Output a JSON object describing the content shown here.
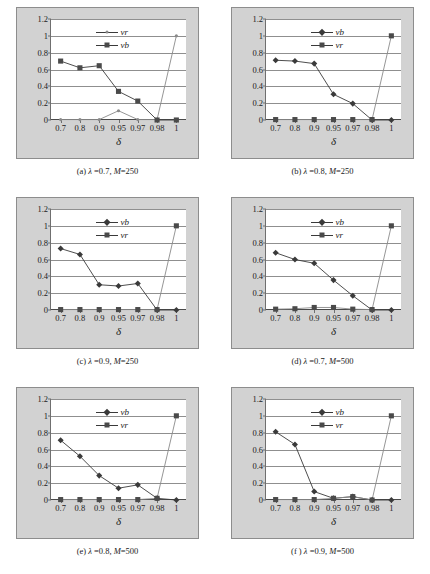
{
  "figure": {
    "panel_count": 6,
    "x_label": "δ",
    "y_ticks": [
      "1.2",
      "1",
      "0.8",
      "0.6",
      "0.4",
      "0.2",
      "0"
    ],
    "x_ticks": [
      "0.7",
      "0.8",
      "0.9",
      "0.95",
      "0.97",
      "0.98",
      "1"
    ],
    "ylim": [
      0,
      1.2
    ],
    "colors": {
      "panel_background": "#d2d2d2",
      "plot_background": "#ffffff",
      "gridline": "#8f8f8f",
      "series_vb": "#3a3a3a",
      "series_vr": "#8a8a8a",
      "text": "#1b1b1b"
    }
  },
  "chart_data": [
    {
      "type": "line",
      "panel": "a",
      "title": "(a) λ =0.7, M=250",
      "caption_prefix": "(a) ",
      "lambda": "0.7",
      "M": "250",
      "xlabel": "δ",
      "ylabel": "",
      "x": [
        "0.7",
        "0.8",
        "0.9",
        "0.95",
        "0.97",
        "0.98",
        "1"
      ],
      "ylim": [
        0,
        1.2
      ],
      "yticks": [
        0,
        0.2,
        0.4,
        0.6,
        0.8,
        1,
        1.2
      ],
      "grid": true,
      "legend_position": "upper-center",
      "legend": [
        "vr",
        "vb"
      ],
      "series": [
        {
          "name": "vr",
          "marker": "small-circle",
          "values": [
            0.005,
            0.005,
            0.005,
            0.11,
            0.005,
            0.005,
            1.0
          ]
        },
        {
          "name": "vb",
          "marker": "square",
          "values": [
            0.7,
            0.62,
            0.645,
            0.34,
            0.225,
            0.0,
            0.0
          ]
        }
      ]
    },
    {
      "type": "line",
      "panel": "b",
      "title": "(b) λ =0.8, M=250",
      "caption_prefix": "(b) ",
      "lambda": "0.8",
      "M": "250",
      "xlabel": "δ",
      "ylabel": "",
      "x": [
        "0.7",
        "0.8",
        "0.9",
        "0.95",
        "0.97",
        "0.98",
        "1"
      ],
      "ylim": [
        0,
        1.2
      ],
      "yticks": [
        0,
        0.2,
        0.4,
        0.6,
        0.8,
        1,
        1.2
      ],
      "grid": true,
      "legend_position": "upper-center",
      "legend": [
        "vb",
        "vr"
      ],
      "series": [
        {
          "name": "vb",
          "marker": "diamond",
          "values": [
            0.71,
            0.7,
            0.67,
            0.305,
            0.195,
            0.0,
            0.0
          ]
        },
        {
          "name": "vr",
          "marker": "square",
          "values": [
            0.005,
            0.005,
            0.005,
            0.005,
            0.005,
            0.005,
            1.0
          ]
        }
      ]
    },
    {
      "type": "line",
      "panel": "c",
      "title": "(c) λ =0.9, M=250",
      "caption_prefix": "(c) ",
      "lambda": "0.9",
      "M": "250",
      "xlabel": "δ",
      "ylabel": "",
      "x": [
        "0.7",
        "0.8",
        "0.9",
        "0.95",
        "0.97",
        "0.98",
        "1"
      ],
      "ylim": [
        0,
        1.2
      ],
      "yticks": [
        0,
        0.2,
        0.4,
        0.6,
        0.8,
        1,
        1.2
      ],
      "grid": true,
      "legend_position": "upper-center",
      "legend": [
        "vb",
        "vr"
      ],
      "series": [
        {
          "name": "vb",
          "marker": "diamond",
          "values": [
            0.73,
            0.66,
            0.3,
            0.285,
            0.315,
            0.0,
            0.0
          ]
        },
        {
          "name": "vr",
          "marker": "square",
          "values": [
            0.005,
            0.005,
            0.005,
            0.005,
            0.005,
            0.005,
            1.0
          ]
        }
      ]
    },
    {
      "type": "line",
      "panel": "d",
      "title": "(d) λ =0.7, M=500",
      "caption_prefix": "(d) ",
      "lambda": "0.7",
      "M": "500",
      "xlabel": "δ",
      "ylabel": "",
      "x": [
        "0.7",
        "0.8",
        "0.9",
        "0.95",
        "0.97",
        "0.98",
        "1"
      ],
      "ylim": [
        0,
        1.2
      ],
      "yticks": [
        0,
        0.2,
        0.4,
        0.6,
        0.8,
        1,
        1.2
      ],
      "grid": true,
      "legend_position": "upper-center",
      "legend": [
        "vb",
        "vr"
      ],
      "series": [
        {
          "name": "vb",
          "marker": "diamond",
          "values": [
            0.68,
            0.6,
            0.555,
            0.355,
            0.17,
            0.0,
            0.0
          ]
        },
        {
          "name": "vr",
          "marker": "square",
          "values": [
            0.01,
            0.015,
            0.03,
            0.03,
            0.01,
            0.005,
            1.0
          ]
        }
      ]
    },
    {
      "type": "line",
      "panel": "e",
      "title": "(e) λ =0.8, M=500",
      "caption_prefix": "(e) ",
      "lambda": "0.8",
      "M": "500",
      "xlabel": "δ",
      "ylabel": "",
      "x": [
        "0.7",
        "0.8",
        "0.9",
        "0.95",
        "0.97",
        "0.98",
        "1"
      ],
      "ylim": [
        0,
        1.2
      ],
      "yticks": [
        0,
        0.2,
        0.4,
        0.6,
        0.8,
        1,
        1.2
      ],
      "grid": true,
      "legend_position": "upper-center",
      "legend": [
        "vb",
        "vr"
      ],
      "series": [
        {
          "name": "vb",
          "marker": "diamond",
          "values": [
            0.71,
            0.52,
            0.29,
            0.14,
            0.18,
            0.02,
            0.0
          ]
        },
        {
          "name": "vr",
          "marker": "square",
          "values": [
            0.005,
            0.005,
            0.005,
            0.005,
            0.005,
            0.02,
            1.0
          ]
        }
      ]
    },
    {
      "type": "line",
      "panel": "f",
      "title": "(f ) λ =0.9, M=500",
      "caption_prefix": "(f ) ",
      "lambda": "0.9",
      "M": "500",
      "xlabel": "δ",
      "ylabel": "",
      "x": [
        "0.7",
        "0.8",
        "0.9",
        "0.95",
        "0.97",
        "0.98",
        "1"
      ],
      "ylim": [
        0,
        1.2
      ],
      "yticks": [
        0,
        0.2,
        0.4,
        0.6,
        0.8,
        1,
        1.2
      ],
      "grid": true,
      "legend_position": "upper-center",
      "legend": [
        "vb",
        "vr"
      ],
      "series": [
        {
          "name": "vb",
          "marker": "diamond",
          "values": [
            0.81,
            0.66,
            0.1,
            0.02,
            0.04,
            0.0,
            0.0
          ]
        },
        {
          "name": "vr",
          "marker": "square",
          "values": [
            0.005,
            0.005,
            0.005,
            0.02,
            0.04,
            0.0,
            1.0
          ]
        }
      ]
    }
  ]
}
